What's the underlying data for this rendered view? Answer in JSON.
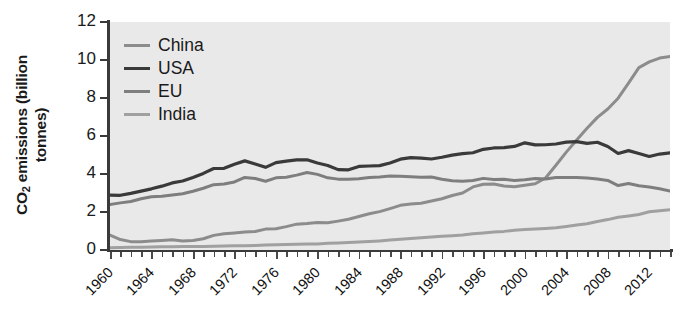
{
  "chart_data": {
    "type": "line",
    "title": "",
    "xlabel": "",
    "ylabel": "CO2 emissions (billion tonnes)",
    "ylabel_line1": "CO",
    "ylabel_sub": "2",
    "ylabel_line1_rest": " emissions (billion",
    "ylabel_line2": "tonnes)",
    "xlim": [
      1960,
      2014
    ],
    "ylim": [
      0,
      12
    ],
    "yticks": [
      0,
      2,
      4,
      6,
      8,
      10,
      12
    ],
    "xticks": [
      1960,
      1964,
      1968,
      1972,
      1976,
      1980,
      1984,
      1988,
      1992,
      1996,
      2000,
      2004,
      2008,
      2012
    ],
    "xtick_step_minor": 1,
    "grid": false,
    "legend_position": "top-left-inside",
    "plot_background": "#e9e9e9",
    "x": [
      1960,
      1961,
      1962,
      1963,
      1964,
      1965,
      1966,
      1967,
      1968,
      1969,
      1970,
      1971,
      1972,
      1973,
      1974,
      1975,
      1976,
      1977,
      1978,
      1979,
      1980,
      1981,
      1982,
      1983,
      1984,
      1985,
      1986,
      1987,
      1988,
      1989,
      1990,
      1991,
      1992,
      1993,
      1994,
      1995,
      1996,
      1997,
      1998,
      1999,
      2000,
      2001,
      2002,
      2003,
      2004,
      2005,
      2006,
      2007,
      2008,
      2009,
      2010,
      2011,
      2012,
      2013,
      2014
    ],
    "series": [
      {
        "name": "China",
        "color": "#8c8c8c",
        "width": 3.0,
        "values": [
          0.78,
          0.55,
          0.44,
          0.44,
          0.47,
          0.5,
          0.54,
          0.47,
          0.5,
          0.59,
          0.77,
          0.86,
          0.9,
          0.95,
          0.97,
          1.1,
          1.12,
          1.23,
          1.36,
          1.39,
          1.45,
          1.43,
          1.52,
          1.62,
          1.76,
          1.91,
          2.02,
          2.18,
          2.35,
          2.42,
          2.46,
          2.58,
          2.7,
          2.87,
          3.0,
          3.32,
          3.46,
          3.47,
          3.37,
          3.33,
          3.41,
          3.49,
          3.79,
          4.46,
          5.15,
          5.79,
          6.41,
          6.98,
          7.42,
          7.99,
          8.78,
          9.6,
          9.9,
          10.1,
          10.18
        ]
      },
      {
        "name": "USA",
        "color": "#3a3a3a",
        "width": 3.2,
        "values": [
          2.89,
          2.88,
          2.98,
          3.1,
          3.22,
          3.36,
          3.53,
          3.63,
          3.82,
          4.03,
          4.29,
          4.3,
          4.51,
          4.69,
          4.53,
          4.35,
          4.6,
          4.68,
          4.74,
          4.75,
          4.58,
          4.45,
          4.23,
          4.22,
          4.4,
          4.42,
          4.44,
          4.58,
          4.78,
          4.86,
          4.84,
          4.79,
          4.88,
          4.99,
          5.07,
          5.12,
          5.3,
          5.37,
          5.39,
          5.45,
          5.64,
          5.53,
          5.54,
          5.58,
          5.68,
          5.7,
          5.61,
          5.67,
          5.45,
          5.08,
          5.23,
          5.08,
          4.92,
          5.05,
          5.11
        ]
      },
      {
        "name": "EU",
        "color": "#7e7e7e",
        "width": 3.0,
        "values": [
          2.4,
          2.48,
          2.55,
          2.7,
          2.8,
          2.83,
          2.9,
          2.96,
          3.09,
          3.25,
          3.44,
          3.47,
          3.58,
          3.82,
          3.76,
          3.62,
          3.8,
          3.83,
          3.94,
          4.08,
          3.98,
          3.8,
          3.73,
          3.72,
          3.75,
          3.81,
          3.84,
          3.9,
          3.88,
          3.85,
          3.83,
          3.84,
          3.72,
          3.64,
          3.62,
          3.66,
          3.77,
          3.71,
          3.72,
          3.66,
          3.7,
          3.76,
          3.74,
          3.81,
          3.82,
          3.81,
          3.79,
          3.74,
          3.66,
          3.39,
          3.5,
          3.38,
          3.32,
          3.22,
          3.1
        ]
      },
      {
        "name": "India",
        "color": "#a0a0a0",
        "width": 3.0,
        "values": [
          0.12,
          0.13,
          0.14,
          0.15,
          0.16,
          0.17,
          0.17,
          0.18,
          0.18,
          0.19,
          0.2,
          0.21,
          0.22,
          0.23,
          0.24,
          0.26,
          0.27,
          0.29,
          0.3,
          0.31,
          0.32,
          0.35,
          0.37,
          0.39,
          0.42,
          0.45,
          0.48,
          0.52,
          0.56,
          0.6,
          0.64,
          0.68,
          0.72,
          0.75,
          0.79,
          0.85,
          0.9,
          0.95,
          0.98,
          1.04,
          1.08,
          1.1,
          1.13,
          1.17,
          1.24,
          1.31,
          1.38,
          1.5,
          1.6,
          1.72,
          1.79,
          1.87,
          2.01,
          2.07,
          2.12
        ]
      }
    ]
  },
  "legend": {
    "items": [
      {
        "label": "China"
      },
      {
        "label": "USA"
      },
      {
        "label": "EU"
      },
      {
        "label": "India"
      }
    ]
  }
}
